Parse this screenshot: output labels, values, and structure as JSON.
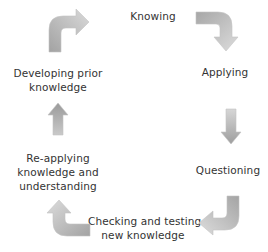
{
  "diagram": {
    "type": "cycle",
    "arrow_color_light": "#d8d8d8",
    "arrow_color_dark": "#a8a8a8",
    "text_color": "#333333",
    "stages": [
      {
        "id": "knowing",
        "lines": [
          "Knowing"
        ]
      },
      {
        "id": "applying",
        "lines": [
          "Applying"
        ]
      },
      {
        "id": "questioning",
        "lines": [
          "Questioning"
        ]
      },
      {
        "id": "checking",
        "lines": [
          "Checking and testing",
          "new knowledge"
        ]
      },
      {
        "id": "reapplying",
        "lines": [
          "Re-applying",
          "knowledge and",
          "understanding"
        ]
      },
      {
        "id": "developing",
        "lines": [
          "Developing prior",
          "knowledge"
        ]
      }
    ],
    "arrows": [
      {
        "from": "developing",
        "to": "knowing",
        "icon": "curved-arrow-up-right"
      },
      {
        "from": "knowing",
        "to": "applying",
        "icon": "curved-arrow-right-down"
      },
      {
        "from": "applying",
        "to": "questioning",
        "icon": "arrow-down"
      },
      {
        "from": "questioning",
        "to": "checking",
        "icon": "curved-arrow-down-left"
      },
      {
        "from": "checking",
        "to": "reapplying",
        "icon": "curved-arrow-left-up"
      },
      {
        "from": "reapplying",
        "to": "developing",
        "icon": "arrow-up"
      }
    ]
  }
}
